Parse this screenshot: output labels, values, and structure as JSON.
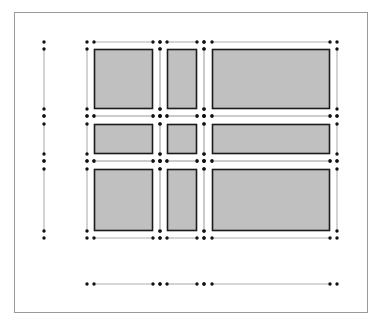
{
  "diagram": {
    "type": "grid-layout-diagram",
    "colors": {
      "frame": "#9a9a9a",
      "guide_line": "#c8c8c8",
      "dot": "#111111",
      "cell_fill": "#c0c0c0",
      "cell_stroke": "#1a1a1a"
    },
    "columns": [
      {
        "outer": [
          87,
          160
        ],
        "inner": [
          94,
          153
        ]
      },
      {
        "outer": [
          160,
          204
        ],
        "inner": [
          167,
          197
        ]
      },
      {
        "outer": [
          204,
          337
        ],
        "inner": [
          212,
          330
        ]
      }
    ],
    "rows": [
      {
        "outer": [
          42,
          116
        ],
        "inner": [
          49,
          109
        ]
      },
      {
        "outer": [
          116,
          161
        ],
        "inner": [
          124,
          154
        ]
      },
      {
        "outer": [
          161,
          238
        ],
        "inner": [
          169,
          231
        ]
      }
    ],
    "left_ruler": {
      "x": 44
    },
    "bottom_ruler": {
      "y": 284
    }
  }
}
